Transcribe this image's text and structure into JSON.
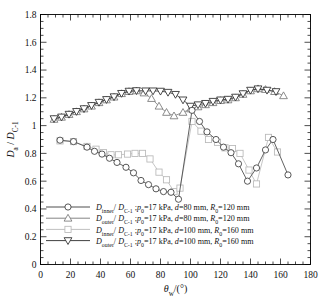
{
  "chart_data": {
    "type": "line",
    "title": "",
    "xlabel": "θ_w/(°)",
    "ylabel": "D_a / D_C-1",
    "xlim": [
      0,
      180
    ],
    "ylim": [
      0,
      1.8
    ],
    "xticks": [
      0,
      20,
      40,
      60,
      80,
      100,
      120,
      140,
      160,
      180
    ],
    "xtick_labels": [
      "0",
      "20",
      "40",
      "60",
      "80",
      "100",
      "120",
      "140",
      "160",
      "180"
    ],
    "yticks": [
      0,
      0.2,
      0.4,
      0.6,
      0.8,
      1,
      1.2,
      1.4,
      1.6,
      1.8
    ],
    "ytick_labels": [
      "0",
      "0.2",
      "0.4",
      "0.6",
      "0.8",
      "1",
      "1.2",
      "1.4",
      "1.6",
      "1.8"
    ],
    "xminor_step": 5,
    "yminor_step": 0.05,
    "grid": false,
    "legend_position": "lower-left-inside",
    "series": [
      {
        "name": "D_inner/D_C-1 ; p0=17 kPa, d=80 mm, R0=120 mm",
        "marker": "circle",
        "color": "#3a3a3a",
        "x": [
          13,
          22,
          31,
          36,
          41,
          46,
          51,
          57,
          62,
          67,
          72,
          77,
          82,
          87,
          92,
          101,
          106,
          111,
          117,
          122,
          127,
          132,
          138,
          144,
          150,
          155,
          165
        ],
        "y": [
          0.895,
          0.885,
          0.845,
          0.815,
          0.795,
          0.765,
          0.735,
          0.7,
          0.66,
          0.605,
          0.575,
          0.545,
          0.525,
          0.52,
          0.47,
          1.11,
          1.03,
          0.955,
          0.9,
          0.845,
          0.805,
          0.725,
          0.6,
          0.695,
          0.825,
          0.9,
          0.645
        ]
      },
      {
        "name": "D_outer/D_C-1 ; p0=17 kPa, d=80 mm, R0=120 mm",
        "marker": "triangle-up",
        "color": "#777777",
        "x": [
          9,
          14,
          19,
          24,
          29,
          34,
          39,
          44,
          49,
          54,
          59,
          64,
          69,
          74,
          79,
          84,
          89,
          95,
          100,
          105,
          110,
          115,
          120,
          125,
          130,
          135,
          140,
          145,
          150,
          156,
          162
        ],
        "y": [
          1.045,
          1.06,
          1.08,
          1.1,
          1.12,
          1.14,
          1.165,
          1.185,
          1.205,
          1.23,
          1.245,
          1.25,
          1.235,
          1.195,
          1.14,
          1.095,
          1.07,
          1.095,
          1.12,
          1.135,
          1.15,
          1.165,
          1.18,
          1.185,
          1.2,
          1.225,
          1.25,
          1.265,
          1.26,
          1.245,
          1.215
        ]
      },
      {
        "name": "D_inner/D_C-1 ; p0=17 kPa, d=100 mm, R0=160 mm",
        "marker": "square",
        "color": "#b8b8b8",
        "x": [
          13,
          22,
          31,
          37,
          42,
          47,
          52,
          58,
          63,
          68,
          73,
          79,
          84,
          89,
          93,
          101,
          107,
          112,
          118,
          123,
          128,
          133,
          139,
          144,
          152,
          158
        ],
        "y": [
          0.89,
          0.885,
          0.85,
          0.83,
          0.805,
          0.79,
          0.79,
          0.795,
          0.8,
          0.8,
          0.76,
          0.665,
          0.61,
          0.525,
          0.55,
          1.03,
          0.96,
          0.9,
          0.88,
          0.84,
          0.835,
          0.8,
          0.68,
          0.58,
          0.915,
          0.81
        ]
      },
      {
        "name": "D_outer/D_C-1 ; p0=17 kPa, d=100 mm, R0=160 mm",
        "marker": "triangle-down",
        "color": "#2b2b2b",
        "x": [
          9,
          14,
          19,
          24,
          29,
          34,
          39,
          44,
          49,
          54,
          59,
          64,
          70,
          75,
          80,
          85,
          90,
          95,
          100,
          105,
          110,
          115,
          120,
          125,
          130,
          135,
          140,
          145,
          151,
          157
        ],
        "y": [
          1.05,
          1.062,
          1.082,
          1.102,
          1.122,
          1.145,
          1.168,
          1.188,
          1.208,
          1.232,
          1.248,
          1.252,
          1.25,
          1.25,
          1.248,
          1.24,
          1.225,
          1.185,
          1.14,
          1.15,
          1.16,
          1.175,
          1.185,
          1.19,
          1.205,
          1.23,
          1.255,
          1.265,
          1.255,
          1.245
        ]
      }
    ]
  },
  "legend": {
    "entries": [
      {
        "marker": "circle",
        "num": "D",
        "num_sub": "inner",
        "den": "D",
        "den_sub": "C-1",
        "p_sym": "p",
        "p_sub": "0",
        "p_val": "=17 kPa,",
        "d_sym": "d",
        "d_val": "=80 mm,",
        "r_sym": "R",
        "r_sub": "0",
        "r_val": "=120 mm"
      },
      {
        "marker": "triangle-up",
        "num": "D",
        "num_sub": "outer",
        "den": "D",
        "den_sub": "C-1",
        "p_sym": "p",
        "p_sub": "0",
        "p_val": "=17 kPa,",
        "d_sym": "d",
        "d_val": "=80 mm,",
        "r_sym": "R",
        "r_sub": "0",
        "r_val": "=120 mm"
      },
      {
        "marker": "square",
        "num": "D",
        "num_sub": "inner",
        "den": "D",
        "den_sub": "C-1",
        "p_sym": "p",
        "p_sub": "0",
        "p_val": "=17 kPa,",
        "d_sym": "d",
        "d_val": "=100 mm,",
        "r_sym": "R",
        "r_sub": "0",
        "r_val": "=160 mm"
      },
      {
        "marker": "triangle-down",
        "num": "D",
        "num_sub": "outer",
        "den": "D",
        "den_sub": "C-1",
        "p_sym": "p",
        "p_sub": "0",
        "p_val": "=17 kPa,",
        "d_sym": "d",
        "d_val": "=100 mm,",
        "r_sym": "R",
        "r_sub": "0",
        "r_val": "=160 mm"
      }
    ]
  },
  "axis_labels": {
    "y_num": "D",
    "y_num_sub": "a",
    "y_den": "D",
    "y_den_sub": "C-1",
    "x_sym": "θ",
    "x_sub": "w",
    "x_rest": "/(°)"
  }
}
